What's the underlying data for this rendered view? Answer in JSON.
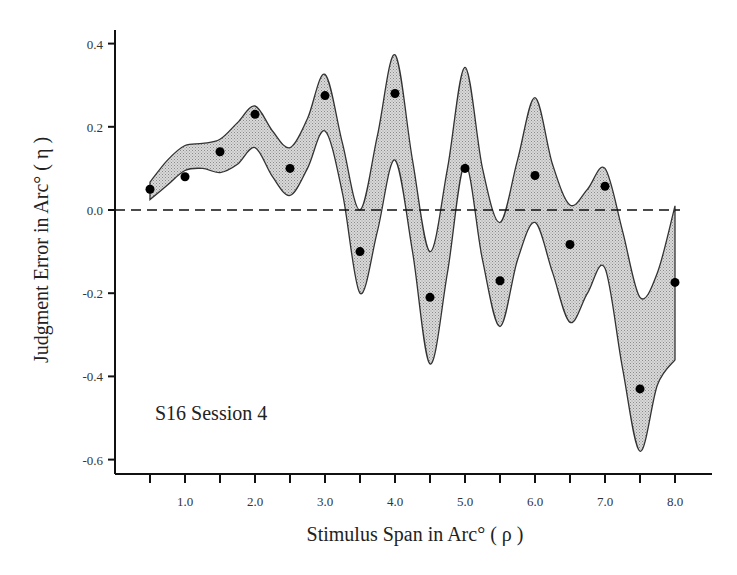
{
  "chart_data": {
    "type": "line",
    "title": "",
    "xlabel": "Stimulus Span in Arc° ( ρ )",
    "ylabel": "Judgment Error in Arc° ( η )",
    "annotation": "S16 Session 4",
    "xlim": [
      0,
      8.5
    ],
    "ylim": [
      -0.63,
      0.42
    ],
    "x_ticks": [
      0.5,
      1.0,
      1.5,
      2.0,
      2.5,
      3.0,
      3.5,
      4.0,
      4.5,
      5.0,
      5.5,
      6.0,
      6.5,
      7.0,
      7.5,
      8.0
    ],
    "x_tick_labels": [
      "1.0",
      "2.0",
      "3.0",
      "4.0",
      "5.0",
      "6.0",
      "7.0",
      "8.0"
    ],
    "y_ticks": [
      0.4,
      0.2,
      0.0,
      -0.2,
      -0.4,
      -0.6
    ],
    "y_tick_labels": [
      "0.4",
      "0.2",
      "0.0",
      "-0.2",
      "-0.4",
      "-0.6"
    ],
    "grid": false,
    "reference_line": {
      "y": 0.0,
      "style": "dashed"
    },
    "series": [
      {
        "name": "Judgment error (points)",
        "type": "scatter",
        "x": [
          0.5,
          1.0,
          1.5,
          2.0,
          2.5,
          3.0,
          3.5,
          4.0,
          4.5,
          5.0,
          5.5,
          6.0,
          6.5,
          7.0,
          7.5,
          8.0
        ],
        "values": [
          0.05,
          0.08,
          0.14,
          0.23,
          0.1,
          0.275,
          -0.1,
          0.28,
          -0.21,
          0.1,
          -0.17,
          0.083,
          -0.083,
          0.057,
          -0.43,
          -0.174
        ]
      },
      {
        "name": "Confidence band upper",
        "type": "area",
        "x": [
          0.5,
          0.75,
          1.0,
          1.25,
          1.5,
          1.75,
          2.0,
          2.25,
          2.5,
          2.75,
          3.0,
          3.25,
          3.5,
          3.75,
          4.0,
          4.25,
          4.5,
          4.75,
          5.0,
          5.25,
          5.5,
          5.75,
          6.0,
          6.25,
          6.5,
          6.75,
          7.0,
          7.25,
          7.5,
          7.75,
          8.0
        ],
        "values": [
          0.067,
          0.12,
          0.155,
          0.16,
          0.17,
          0.21,
          0.25,
          0.19,
          0.15,
          0.22,
          0.326,
          0.16,
          0.0,
          0.18,
          0.373,
          0.12,
          -0.1,
          0.1,
          0.343,
          0.1,
          -0.03,
          0.12,
          0.27,
          0.11,
          0.012,
          0.05,
          0.1,
          -0.05,
          -0.21,
          -0.15,
          0.01
        ]
      },
      {
        "name": "Confidence band lower",
        "type": "area",
        "x": [
          0.5,
          0.75,
          1.0,
          1.25,
          1.5,
          1.75,
          2.0,
          2.25,
          2.5,
          2.75,
          3.0,
          3.25,
          3.5,
          3.75,
          4.0,
          4.25,
          4.5,
          4.75,
          5.0,
          5.25,
          5.5,
          5.75,
          6.0,
          6.25,
          6.5,
          6.75,
          7.0,
          7.25,
          7.5,
          7.75,
          8.0
        ],
        "values": [
          0.025,
          0.06,
          0.095,
          0.1,
          0.09,
          0.11,
          0.15,
          0.08,
          0.035,
          0.1,
          0.19,
          0.04,
          -0.2,
          -0.05,
          0.12,
          -0.1,
          -0.37,
          -0.15,
          0.11,
          -0.12,
          -0.28,
          -0.12,
          -0.03,
          -0.15,
          -0.27,
          -0.2,
          -0.14,
          -0.38,
          -0.58,
          -0.42,
          -0.36
        ]
      }
    ],
    "colors": {
      "band_fill": "#c8c8c8",
      "band_stroke": "#333333",
      "points": "#000000",
      "axes": "#111111"
    }
  }
}
